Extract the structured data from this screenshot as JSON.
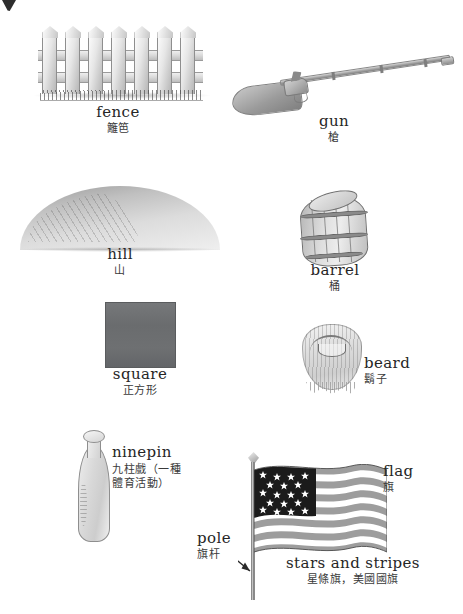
{
  "page": {
    "background": "#ffffff",
    "text_color": "#262626",
    "width": 463,
    "height": 614,
    "corner_mark": "page-corner-artifact"
  },
  "entries": [
    {
      "id": "fence",
      "en": "fence",
      "zh": "籬笆",
      "illustration": "white-picket-fence-illustration"
    },
    {
      "id": "gun",
      "en": "gun",
      "zh": "槍",
      "illustration": "long-musket-rifle-illustration"
    },
    {
      "id": "hill",
      "en": "hill",
      "zh": "山",
      "illustration": "rounded-hill-illustration"
    },
    {
      "id": "barrel",
      "en": "barrel",
      "zh": "桶",
      "illustration": "wooden-barrel-illustration"
    },
    {
      "id": "square",
      "en": "square",
      "zh": "正方形",
      "illustration": "grey-filled-square-illustration"
    },
    {
      "id": "beard",
      "en": "beard",
      "zh": "鬍子",
      "illustration": "bearded-face-illustration"
    },
    {
      "id": "ninepin",
      "en": "ninepin",
      "zh": "九柱戲（一種\n體育活動）",
      "illustration": "bowling-ninepin-illustration"
    },
    {
      "id": "flag",
      "en": "flag",
      "zh": "旗",
      "illustration": "american-flag-illustration"
    },
    {
      "id": "pole",
      "en": "pole",
      "zh": "旗杆",
      "illustration": "flag-pole-with-pointer-arrow"
    },
    {
      "id": "stars-and-stripes",
      "en": "stars and stripes",
      "zh": "星條旗，美國國旗",
      "illustration": "american-flag-illustration"
    }
  ],
  "flag": {
    "stripe_count": 13,
    "star_rows": 5,
    "canton_color": "#1b1b1b",
    "stripe_color": "#9d9d9d",
    "field_color": "#ffffff"
  },
  "colors": {
    "square_fill": "#6e7072",
    "ink": "#262626",
    "pencil_grey": "#9a9a9a"
  }
}
